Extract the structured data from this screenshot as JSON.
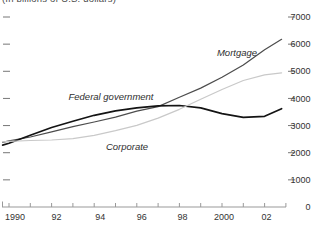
{
  "chart": {
    "subtitle": "(In billions of U.S. dollars)",
    "colors": {
      "mortgage_line": "#4d4d4d",
      "federal_line": "#141414",
      "corporate_line": "#c9c9c9",
      "axis": "#999999",
      "y_dash": "#777777",
      "tick_label": "#333333"
    }
  },
  "chart_data": {
    "type": "line",
    "title": "",
    "subtitle": "(In billions of U.S. dollars)",
    "xlabel": "",
    "ylabel": "",
    "xlim": [
      1989.7,
      2003
    ],
    "ylim": [
      0,
      7000
    ],
    "grid": false,
    "legend_position": "inline-labels",
    "x": [
      1989.7,
      1990,
      1991,
      1992,
      1993,
      1994,
      1995,
      1996,
      1997,
      1998,
      1999,
      2000,
      2001,
      2002,
      2002.8
    ],
    "series": [
      {
        "name": "Mortgage",
        "color": "#4d4d4d",
        "width": 1.25,
        "values": [
          2380,
          2440,
          2580,
          2770,
          2960,
          3130,
          3310,
          3530,
          3700,
          4040,
          4380,
          4780,
          5230,
          5790,
          6180
        ]
      },
      {
        "name": "Federal government",
        "color": "#141414",
        "width": 1.7,
        "values": [
          2280,
          2350,
          2640,
          2930,
          3160,
          3380,
          3540,
          3650,
          3730,
          3740,
          3650,
          3440,
          3300,
          3340,
          3620
        ]
      },
      {
        "name": "Corporate",
        "color": "#c9c9c9",
        "width": 1.25,
        "values": [
          2400,
          2420,
          2450,
          2470,
          2520,
          2640,
          2810,
          3010,
          3270,
          3600,
          3970,
          4330,
          4660,
          4870,
          4940
        ]
      }
    ],
    "y_ticks": [
      0,
      1000,
      2000,
      3000,
      4000,
      5000,
      6000,
      7000
    ],
    "y_tick_labels": [
      "0",
      "1000",
      "2000",
      "3000",
      "4000",
      "5000",
      "6000",
      "7000"
    ],
    "x_ticks": [
      1990,
      1991,
      1992,
      1993,
      1994,
      1995,
      1996,
      1997,
      1998,
      1999,
      2000,
      2001,
      2002,
      2003
    ],
    "x_tick_labels": [
      {
        "year": 1990,
        "label": "1990",
        "dx": 6
      },
      {
        "year": 1992,
        "label": "92",
        "dx": 5
      },
      {
        "year": 1994,
        "label": "94",
        "dx": 6
      },
      {
        "year": 1996,
        "label": "96",
        "dx": 5
      },
      {
        "year": 1998,
        "label": "98",
        "dx": 3
      },
      {
        "year": 2000,
        "label": "2000",
        "dx": 2
      },
      {
        "year": 2002,
        "label": "02",
        "dx": 2
      }
    ]
  }
}
